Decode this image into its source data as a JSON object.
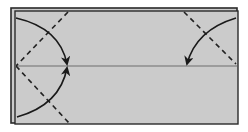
{
  "diagram": {
    "type": "origami-fold-instructions",
    "colors": {
      "paper": "#cbcbcb",
      "outline": "#2a2a2a",
      "crease": "#8c8c8c",
      "fold_line": "#222222",
      "arrow": "#1a1a1a"
    },
    "paper": {
      "back_layer": {
        "x": 11,
        "y": 8,
        "w": 226,
        "h": 115
      },
      "front_layer": {
        "x": 15,
        "y": 11,
        "w": 223,
        "h": 113
      }
    },
    "center_crease": {
      "y": 66,
      "x1": 15,
      "x2": 237
    },
    "valley_folds": [
      {
        "name": "top-left-diagonal",
        "x1": 68,
        "y1": 12,
        "x2": 16,
        "y2": 66
      },
      {
        "name": "bottom-left-diagonal",
        "x1": 16,
        "y1": 66,
        "x2": 69,
        "y2": 123
      },
      {
        "name": "top-right-diagonal",
        "x1": 184,
        "y1": 12,
        "x2": 236,
        "y2": 64
      }
    ],
    "arrows": [
      {
        "name": "fold-top-left-corner-arrow",
        "path": "M16 18 Q60 28 67 64"
      },
      {
        "name": "fold-bottom-left-corner-arrow",
        "path": "M17 117 Q60 105 67 68"
      },
      {
        "name": "fold-top-right-corner-arrow",
        "path": "M236 18 Q196 30 187 64"
      }
    ]
  }
}
